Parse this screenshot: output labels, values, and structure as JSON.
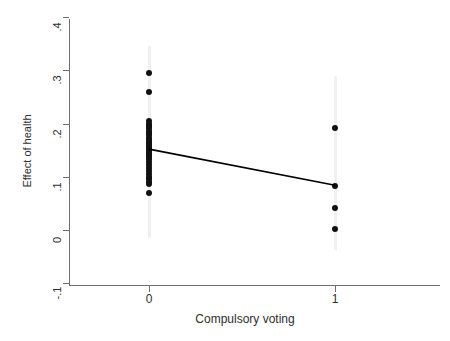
{
  "chart_data": {
    "type": "scatter",
    "title": "",
    "xlabel": "Compulsory voting",
    "ylabel": "Effect of health",
    "xlim": [
      -0.43,
      1.57
    ],
    "ylim": [
      -0.1,
      0.4
    ],
    "grid": false,
    "legend": null,
    "x_ticks": [
      0,
      1
    ],
    "x_tick_labels": [
      "0",
      "1"
    ],
    "y_ticks": [
      -0.1,
      0,
      0.1,
      0.2,
      0.3,
      0.4
    ],
    "y_tick_labels": [
      "-.1",
      "0",
      ".1",
      ".2",
      ".3",
      ".4"
    ],
    "series": [
      {
        "name": "Observations",
        "type": "scatter",
        "marker": "filled-circle",
        "color": "#111111",
        "points": [
          {
            "x": 0,
            "y": 0.295
          },
          {
            "x": 0,
            "y": 0.26
          },
          {
            "x": 0,
            "y": 0.204
          },
          {
            "x": 0,
            "y": 0.2
          },
          {
            "x": 0,
            "y": 0.196
          },
          {
            "x": 0,
            "y": 0.191
          },
          {
            "x": 0,
            "y": 0.187
          },
          {
            "x": 0,
            "y": 0.182
          },
          {
            "x": 0,
            "y": 0.178
          },
          {
            "x": 0,
            "y": 0.173
          },
          {
            "x": 0,
            "y": 0.169
          },
          {
            "x": 0,
            "y": 0.166
          },
          {
            "x": 0,
            "y": 0.162
          },
          {
            "x": 0,
            "y": 0.158
          },
          {
            "x": 0,
            "y": 0.155
          },
          {
            "x": 0,
            "y": 0.152
          },
          {
            "x": 0,
            "y": 0.149
          },
          {
            "x": 0,
            "y": 0.145
          },
          {
            "x": 0,
            "y": 0.141
          },
          {
            "x": 0,
            "y": 0.137
          },
          {
            "x": 0,
            "y": 0.133
          },
          {
            "x": 0,
            "y": 0.128
          },
          {
            "x": 0,
            "y": 0.122
          },
          {
            "x": 0,
            "y": 0.116
          },
          {
            "x": 0,
            "y": 0.11
          },
          {
            "x": 0,
            "y": 0.105
          },
          {
            "x": 0,
            "y": 0.1
          },
          {
            "x": 0,
            "y": 0.095
          },
          {
            "x": 0,
            "y": 0.091
          },
          {
            "x": 0,
            "y": 0.087
          },
          {
            "x": 0,
            "y": 0.069
          },
          {
            "x": 1,
            "y": 0.191
          },
          {
            "x": 1,
            "y": 0.082
          },
          {
            "x": 1,
            "y": 0.042
          },
          {
            "x": 1,
            "y": 0.001
          }
        ]
      },
      {
        "name": "Fitted line",
        "type": "line",
        "color": "#000000",
        "points": [
          {
            "x": 0,
            "y": 0.152
          },
          {
            "x": 1,
            "y": 0.084
          }
        ]
      }
    ],
    "ranges": [
      {
        "x": 0,
        "y_low": -0.015,
        "y_high": 0.345,
        "color": "#f0f0f0"
      },
      {
        "x": 1,
        "y_low": -0.038,
        "y_high": 0.29,
        "color": "#f0f0f0"
      }
    ],
    "colors": {
      "marker": "#111111",
      "fit_line": "#000000",
      "axis": "#6f6f6f",
      "range_band": "#f0f0f0",
      "background": "#ffffff",
      "text": "#2e2e2e"
    }
  },
  "axes": {
    "y_title": "Effect of health",
    "x_title": "Compulsory voting",
    "y_labels": [
      "-.1",
      "0",
      ".1",
      ".2",
      ".3",
      ".4"
    ],
    "x_labels": [
      "0",
      "1"
    ]
  }
}
